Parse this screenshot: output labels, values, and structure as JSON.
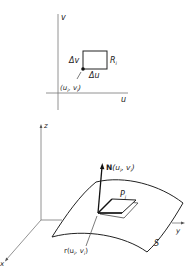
{
  "figure": {
    "top": {
      "axis_v_label": "v",
      "axis_u_label": "u",
      "delta_v_label": "Δv",
      "delta_u_label": "Δu",
      "region_label": "R",
      "region_subscript": "i",
      "point_label": "(u",
      "point_sub1": "i",
      "point_mid": ", v",
      "point_sub2": "i",
      "point_end": ")"
    },
    "bottom": {
      "axis_z_label": "z",
      "axis_x_label": "x",
      "axis_y_label": "y",
      "normal_label": "N",
      "normal_args": "(u",
      "normal_sub1": "i",
      "normal_mid": ", v",
      "normal_sub2": "i",
      "normal_end": ")",
      "patch_label": "P",
      "patch_subscript": "i",
      "surface_label": "S",
      "position_label": "r(u",
      "position_sub1": "i",
      "position_mid": ", v",
      "position_sub2": "i",
      "position_end": ")"
    },
    "colors": {
      "stroke": "#222222",
      "light_stroke": "#777777",
      "background": "#ffffff"
    }
  }
}
